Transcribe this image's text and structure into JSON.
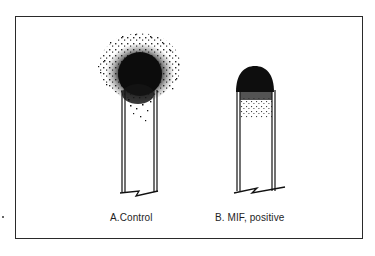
{
  "figure": {
    "panels": [
      {
        "id": "A",
        "caption": "A.Control",
        "description": "Tall tube with large diffuse cloud of migrating cells above the top"
      },
      {
        "id": "B",
        "caption": "B. MIF, positive",
        "description": "Tube with compact dome of cells, migration inhibited"
      }
    ],
    "colors": {
      "ink": "#111111",
      "frame": "#2a2a2a",
      "background": "#ffffff"
    }
  }
}
